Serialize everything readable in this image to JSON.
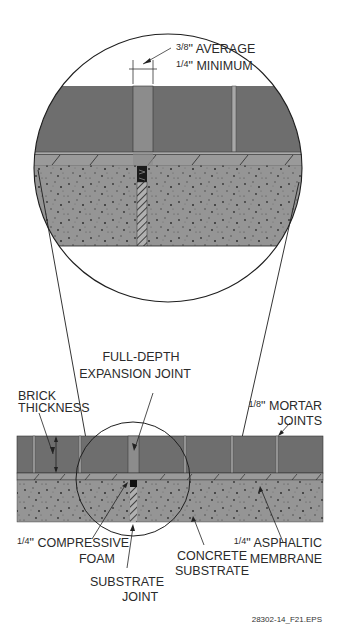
{
  "figure": {
    "id_label": "28302-14_F21.EPS"
  },
  "detail_view": {
    "dimension_label_line1": "3/8\" AVERAGE",
    "dimension_label_line2": "1/4\" MINIMUM",
    "dimension_fraction_1": "3/8",
    "dimension_text_1": "\" AVERAGE",
    "dimension_fraction_2": "1/4",
    "dimension_text_2": "\" MINIMUM"
  },
  "section_view": {
    "labels": {
      "expansion_joint_line1": "FULL-DEPTH",
      "expansion_joint_line2": "EXPANSION JOINT",
      "brick_thickness_line1": "BRICK",
      "brick_thickness_line2": "THICKNESS",
      "mortar_joints_line1": "1/8\" MORTAR",
      "mortar_joints_line2": "JOINTS",
      "compressive_foam_line1": "1/4\" COMPRESSIVE",
      "compressive_foam_line2": "FOAM",
      "concrete_substrate_line1": "CONCRETE",
      "concrete_substrate_line2": "SUBSTRATE",
      "asphaltic_membrane_line1": "1/4\" ASPHALTIC",
      "asphaltic_membrane_line2": "MEMBRANE",
      "substrate_joint_line1": "SUBSTRATE",
      "substrate_joint_line2": "JOINT"
    }
  },
  "colors": {
    "brick": "#6e6e6e",
    "expansion_joint": "#8c8c8c",
    "mortar": "#a8a8a8",
    "membrane": "#9a9a9a",
    "concrete": "#959595",
    "line": "#1e1e1e"
  }
}
